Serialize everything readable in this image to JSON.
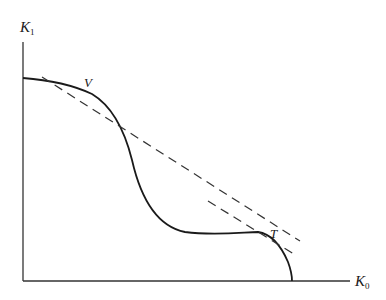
{
  "diagram": {
    "type": "production-possibility-frontier",
    "axes": {
      "y": {
        "symbol": "K",
        "subscript": "1"
      },
      "x": {
        "symbol": "K",
        "subscript": "0"
      }
    },
    "points": [
      {
        "label": "V"
      },
      {
        "label": "T"
      }
    ],
    "curve": "solid frontier curve with inflection, tangent dashed lines at V and T",
    "tangent_lines": [
      {
        "at": "V",
        "style": "dashed"
      },
      {
        "at": "T",
        "style": "dashed"
      }
    ]
  }
}
